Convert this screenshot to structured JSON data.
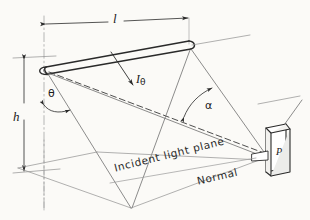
{
  "figure": {
    "kind": "optics-illumination-geometry-diagram",
    "background_color": "#fbfaf7",
    "ink_color": "#2a2a2a",
    "labels": {
      "length": "l",
      "height": "h",
      "luminous_intensity": "I",
      "luminous_intensity_subscript": "θ",
      "angle_theta": "θ",
      "angle_alpha": "α",
      "point": "P",
      "incident_plane": "Incident light plane",
      "normal": "Normal"
    },
    "elements": {
      "lamp": "linear tube light source",
      "dimension_length": "horizontal dimension line for l",
      "dimension_height": "vertical dimension line for h",
      "ray": "arrow for I subscript theta",
      "arc_theta": "double-headed arc for theta",
      "arc_alpha": "double-headed arc for alpha",
      "plate": "illuminated plate at point P",
      "axis": "vertical dash-dot centre line",
      "light_plane": "dashed incident light plane trace"
    }
  }
}
